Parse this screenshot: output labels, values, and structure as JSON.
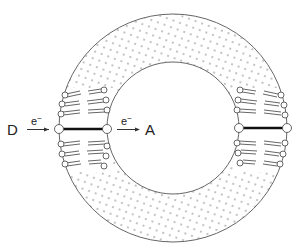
{
  "diagram": {
    "type": "vesicle-membrane-electron-transfer",
    "labels": {
      "donor": "D",
      "acceptor": "A",
      "electron_left": "e",
      "electron_right": "e",
      "electron_superscript": "−"
    },
    "colors": {
      "outline": "#555555",
      "dots": "#777777",
      "bond": "#111111",
      "head_fill": "#ffffff"
    },
    "geometry": {
      "center": [
        173,
        128
      ],
      "outer_radius": 114,
      "inner_radius": 66
    }
  }
}
